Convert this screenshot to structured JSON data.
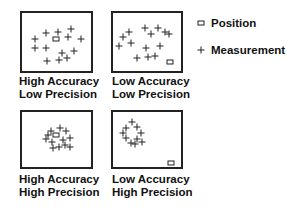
{
  "diagram": {
    "panels": [
      {
        "id": "high-accuracy-low-precision",
        "label_line1": "High Accuracy",
        "label_line2": "Low Precision",
        "box": {
          "left": 20,
          "top": 11,
          "width": 73,
          "height": 62
        },
        "position": {
          "x": 34,
          "y": 26
        },
        "measurements": [
          [
            13,
            26
          ],
          [
            24,
            20
          ],
          [
            36,
            19
          ],
          [
            49,
            16
          ],
          [
            46,
            24
          ],
          [
            59,
            26
          ],
          [
            13,
            35
          ],
          [
            24,
            35
          ],
          [
            40,
            40
          ],
          [
            52,
            38
          ],
          [
            25,
            48
          ],
          [
            37,
            47
          ],
          [
            45,
            45
          ]
        ]
      },
      {
        "id": "low-accuracy-low-precision",
        "label_line1": "Low Accuracy",
        "label_line2": "Low Precision",
        "box": {
          "left": 111,
          "top": 11,
          "width": 72,
          "height": 62
        },
        "position": {
          "x": 57,
          "y": 49
        },
        "measurements": [
          [
            16,
            19
          ],
          [
            10,
            24
          ],
          [
            32,
            15
          ],
          [
            45,
            15
          ],
          [
            38,
            21
          ],
          [
            52,
            19
          ],
          [
            56,
            21
          ],
          [
            6,
            33
          ],
          [
            18,
            30
          ],
          [
            33,
            35
          ],
          [
            47,
            33
          ],
          [
            24,
            45
          ],
          [
            35,
            44
          ],
          [
            42,
            43
          ]
        ]
      },
      {
        "id": "high-accuracy-high-precision",
        "label_line1": "High Accuracy",
        "label_line2": "High Precision",
        "box": {
          "left": 20,
          "top": 110,
          "width": 73,
          "height": 59
        },
        "position": {
          "x": 34,
          "y": 23
        },
        "measurements": [
          [
            38,
            16
          ],
          [
            29,
            19
          ],
          [
            44,
            19
          ],
          [
            26,
            23
          ],
          [
            48,
            26
          ],
          [
            24,
            27
          ],
          [
            30,
            30
          ],
          [
            41,
            28
          ],
          [
            43,
            33
          ],
          [
            31,
            36
          ],
          [
            37,
            35
          ],
          [
            48,
            35
          ]
        ]
      },
      {
        "id": "low-accuracy-high-precision",
        "label_line1": "Low Accuracy",
        "label_line2": "High Precision",
        "box": {
          "left": 111,
          "top": 110,
          "width": 72,
          "height": 59
        },
        "position": {
          "x": 58,
          "y": 51
        },
        "measurements": [
          [
            19,
            10
          ],
          [
            13,
            16
          ],
          [
            24,
            15
          ],
          [
            10,
            21
          ],
          [
            28,
            21
          ],
          [
            13,
            26
          ],
          [
            24,
            27
          ],
          [
            18,
            31
          ],
          [
            22,
            32
          ],
          [
            29,
            30
          ]
        ]
      }
    ]
  },
  "legend": {
    "items": [
      {
        "symbol": "square",
        "label": "Position"
      },
      {
        "symbol": "plus",
        "label": "Measurement"
      }
    ]
  }
}
